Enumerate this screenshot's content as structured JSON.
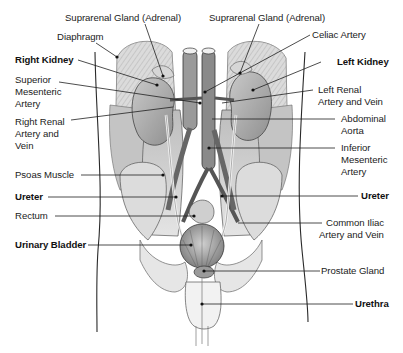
{
  "diagram": {
    "title_cropped": "",
    "labels": {
      "suprarenal_right": "Suprarenal Gland (Adrenal)",
      "suprarenal_left": "Suprarenal Gland (Adrenal)",
      "diaphragm": "Diaphragm",
      "celiac_artery": "Celiac Artery",
      "right_kidney": "Right Kidney",
      "left_kidney": "Left Kidney",
      "superior_mesenteric_1": "Superior",
      "superior_mesenteric_2": "Mesenteric",
      "superior_mesenteric_3": "Artery",
      "left_renal_1": "Left Renal",
      "left_renal_2": "Artery and Vein",
      "right_renal_1": "Right Renal",
      "right_renal_2": "Artery and",
      "right_renal_3": "Vein",
      "abdominal_aorta_1": "Abdominal",
      "abdominal_aorta_2": "Aorta",
      "inferior_mesenteric_1": "Inferior",
      "inferior_mesenteric_2": "Mesenteric",
      "inferior_mesenteric_3": "Artery",
      "psoas_muscle": "Psoas Muscle",
      "ureter_right": "Ureter",
      "ureter_left": "Ureter",
      "rectum": "Rectum",
      "common_iliac_1": "Common Iliac",
      "common_iliac_2": "Artery and Vein",
      "urinary_bladder": "Urinary Bladder",
      "prostate_gland": "Prostate Gland",
      "urethra": "Urethra"
    },
    "bold_labels": [
      "Right Kidney",
      "Left Kidney",
      "Ureter",
      "Urinary Bladder",
      "Urethra"
    ],
    "colors": {
      "background": "#ffffff",
      "ink": "#1a1a1a",
      "tissue_light": "#d9d9d9",
      "tissue_mid": "#a8a8a8",
      "tissue_dark": "#6e6e6e"
    }
  }
}
